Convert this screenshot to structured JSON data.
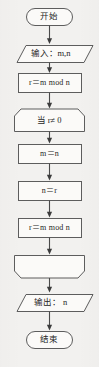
{
  "diagram": {
    "colors": {
      "background": "#f2f1ef",
      "shape_fill": "#fbfaf8",
      "shape_stroke": "#5d5d5d",
      "connector": "#4a4a4a",
      "text": "#262626"
    },
    "nodes": [
      {
        "id": "start",
        "shape": "terminator",
        "label": "开始"
      },
      {
        "id": "input",
        "shape": "parallelogram",
        "label": "输入：m,n"
      },
      {
        "id": "init-r",
        "shape": "process",
        "label": "r＝m mod n"
      },
      {
        "id": "loop-start",
        "shape": "loop-start",
        "label": "当 r≠ 0"
      },
      {
        "id": "assign-m",
        "shape": "process",
        "label": "m＝n"
      },
      {
        "id": "assign-n",
        "shape": "process",
        "label": "n＝r"
      },
      {
        "id": "update-r",
        "shape": "process",
        "label": "r＝m mod n"
      },
      {
        "id": "loop-end",
        "shape": "loop-end",
        "label": ""
      },
      {
        "id": "output",
        "shape": "parallelogram",
        "label": "输出： n"
      },
      {
        "id": "end",
        "shape": "terminator",
        "label": "结束"
      }
    ],
    "connectors": [
      {
        "from": "start",
        "to": "input",
        "arrow": "down"
      },
      {
        "from": "input",
        "to": "init-r",
        "arrow": "down"
      },
      {
        "from": "init-r",
        "to": "loop-start",
        "arrow": "down"
      },
      {
        "from": "loop-start",
        "to": "assign-m",
        "arrow": "down"
      },
      {
        "from": "assign-m",
        "to": "assign-n",
        "arrow": "down"
      },
      {
        "from": "assign-n",
        "to": "update-r",
        "arrow": "down"
      },
      {
        "from": "update-r",
        "to": "loop-end",
        "arrow": "down"
      },
      {
        "from": "loop-end",
        "to": "output",
        "arrow": "down"
      },
      {
        "from": "output",
        "to": "end",
        "arrow": "down"
      }
    ]
  }
}
